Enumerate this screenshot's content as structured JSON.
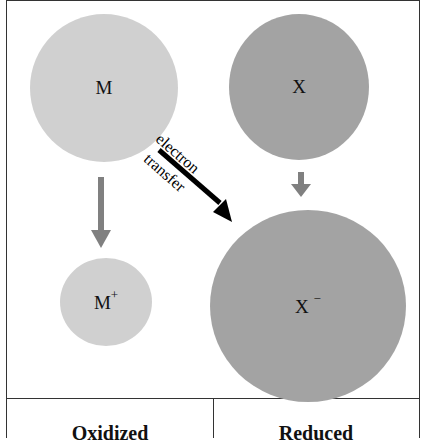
{
  "atoms": {
    "M": {
      "label": "M",
      "shade": "light"
    },
    "X": {
      "label": "X",
      "shade": "dark"
    },
    "M_plus": {
      "label": "M",
      "charge": "+",
      "shade": "light"
    },
    "X_minus": {
      "label": "X",
      "charge": "−",
      "shade": "dark"
    }
  },
  "arrow": {
    "label_top": "electron",
    "label_bottom": "transfer"
  },
  "columns": {
    "left": "Oxidized",
    "right": "Reduced"
  },
  "colors": {
    "light_atom": "#d0d0d0",
    "dark_atom": "#a3a3a3",
    "small_arrow": "#808080",
    "transfer_arrow": "#000000"
  }
}
